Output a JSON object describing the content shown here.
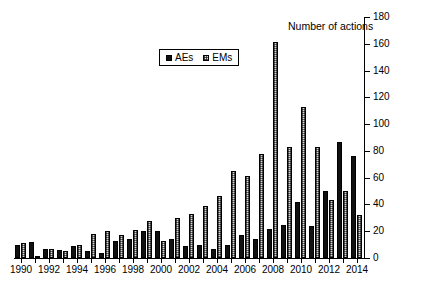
{
  "chart_data": {
    "type": "bar",
    "title": "Number of actions",
    "xlabel": "",
    "ylabel": "",
    "ylim": [
      0,
      180
    ],
    "yticks": [
      0,
      20,
      40,
      60,
      80,
      100,
      120,
      140,
      160,
      180
    ],
    "y_axis_position": "right",
    "grid": false,
    "legend_position": "top-center",
    "categories": [
      "1990",
      "1991",
      "1992",
      "1993",
      "1994",
      "1995",
      "1996",
      "1997",
      "1998",
      "1999",
      "2000",
      "2001",
      "2002",
      "2003",
      "2004",
      "2005",
      "2006",
      "2007",
      "2008",
      "2009",
      "2010",
      "2011",
      "2012",
      "2013",
      "2014"
    ],
    "tick_labels": [
      "1990",
      "1992",
      "1994",
      "1996",
      "1998",
      "2000",
      "2002",
      "2004",
      "2006",
      "2008",
      "2010",
      "2012",
      "2014"
    ],
    "series": [
      {
        "name": "AEs",
        "color": "#111111",
        "values": [
          10,
          12,
          7,
          6,
          9,
          5,
          4,
          13,
          14,
          20,
          20,
          14,
          9,
          10,
          7,
          10,
          17,
          14,
          22,
          25,
          42,
          24,
          50,
          87,
          76
        ]
      },
      {
        "name": "EMs",
        "color": "#d9d9d9",
        "values": [
          11,
          1,
          7,
          5,
          10,
          18,
          20,
          17,
          21,
          28,
          13,
          30,
          33,
          39,
          46,
          65,
          61,
          78,
          161,
          83,
          113,
          83,
          43,
          50,
          32
        ]
      }
    ]
  },
  "legend": {
    "items": [
      {
        "label": "AEs"
      },
      {
        "label": "EMs"
      }
    ]
  }
}
